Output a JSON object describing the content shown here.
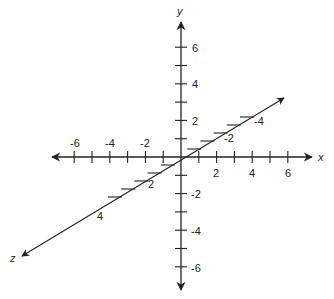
{
  "diagram": {
    "axes": {
      "x": {
        "label": "x",
        "ticks": [
          -6,
          -5,
          -4,
          -3,
          -2,
          -1,
          1,
          2,
          3,
          4,
          5,
          6
        ],
        "labeled_ticks": [
          "-6",
          "-4",
          "-2",
          "2",
          "4",
          "6"
        ]
      },
      "y": {
        "label": "y",
        "ticks": [
          -6,
          -5,
          -4,
          -3,
          -2,
          -1,
          1,
          2,
          3,
          4,
          5,
          6
        ],
        "labeled_ticks": [
          "6",
          "4",
          "2",
          "-2",
          "-4",
          "-6"
        ]
      },
      "z": {
        "label": "z",
        "ticks": [
          -5,
          -4,
          -3,
          -2,
          -1,
          1,
          2,
          3,
          4,
          5
        ],
        "labeled_ticks": [
          "-4",
          "-2",
          "2",
          "4"
        ]
      }
    },
    "colors": {
      "axis": "#222222",
      "background": "#ffffff"
    }
  }
}
